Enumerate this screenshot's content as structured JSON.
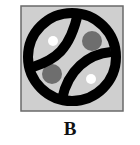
{
  "figure": {
    "label": "B",
    "background_color": "#cfcfcf",
    "border_color": "#6a6a6a",
    "ring_color": "#000000",
    "white_dot_color": "#ffffff",
    "dark_dot_color": "#707070",
    "elements": {
      "ring": "circle-with-two-curved-seams",
      "white_dots": 2,
      "dark_dots": 2
    }
  }
}
